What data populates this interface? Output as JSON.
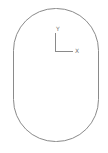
{
  "diagram": {
    "shape": "rounded-rectangle-outline",
    "stroke_color": "#888888",
    "axes": {
      "x_label": "X",
      "y_label": "Y",
      "color": "#888888"
    }
  }
}
